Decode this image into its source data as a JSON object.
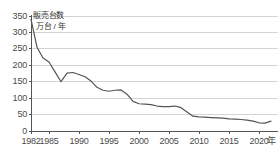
{
  "chart_data": {
    "type": "line",
    "title": "",
    "series_label_lines": [
      "販売台数",
      "万台 / 年"
    ],
    "ylabel": "販売台数 万台 / 年",
    "xlabel": "年",
    "x_unit_label": "年",
    "ylim": [
      0,
      350
    ],
    "yticks": [
      0,
      50,
      100,
      150,
      200,
      250,
      300,
      350
    ],
    "ytick_labels": [
      "0",
      "50",
      "100",
      "150",
      "200",
      "250",
      "300",
      "350"
    ],
    "xlim": [
      1982,
      2022
    ],
    "xticks": [
      1982,
      1985,
      1990,
      1995,
      2000,
      2005,
      2010,
      2015,
      2020
    ],
    "xtick_labels": [
      "1982",
      "1985",
      "1990",
      "1995",
      "2000",
      "2005",
      "2010",
      "2015",
      "2020"
    ],
    "grid": true,
    "grid_axis": "y",
    "legend": false,
    "line_color": "#555555",
    "grid_color": "#c9c9c9",
    "axis_color": "#555555",
    "x": [
      1982,
      1983,
      1984,
      1985,
      1986,
      1987,
      1988,
      1989,
      1990,
      1991,
      1992,
      1993,
      1994,
      1995,
      1996,
      1997,
      1998,
      1999,
      2000,
      2001,
      2002,
      2003,
      2004,
      2005,
      2006,
      2007,
      2008,
      2009,
      2010,
      2011,
      2012,
      2013,
      2014,
      2015,
      2016,
      2017,
      2018,
      2019,
      2020,
      2021,
      2022
    ],
    "values": [
      340,
      255,
      222,
      210,
      180,
      150,
      176,
      178,
      172,
      165,
      152,
      133,
      124,
      121,
      124,
      125,
      112,
      90,
      83,
      82,
      80,
      76,
      74,
      74,
      76,
      71,
      58,
      45,
      43,
      42,
      41,
      40,
      39,
      37,
      36,
      35,
      33,
      30,
      25,
      24,
      30
    ]
  },
  "colors": {
    "background": "#ffffff",
    "line": "#555555",
    "grid": "#c9c9c9",
    "text": "#4a4a4a"
  }
}
